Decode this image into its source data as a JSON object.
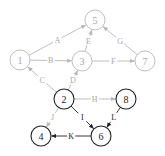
{
  "colors": {
    "light": "#b8b8b8",
    "light_text": "#a8a8a8",
    "dark": "#222222",
    "dark_text": "#222222",
    "background": "#ffffff"
  },
  "nodes": [
    {
      "id": "1",
      "label": "1",
      "x": 20,
      "y": 60,
      "r": 10,
      "style": "light"
    },
    {
      "id": "5",
      "label": "5",
      "x": 95,
      "y": 20,
      "r": 10,
      "style": "light"
    },
    {
      "id": "3",
      "label": "3",
      "x": 82,
      "y": 61,
      "r": 10,
      "style": "light"
    },
    {
      "id": "7",
      "label": "7",
      "x": 145,
      "y": 61,
      "r": 10,
      "style": "light"
    },
    {
      "id": "2",
      "label": "2",
      "x": 64,
      "y": 99,
      "r": 10,
      "style": "dark"
    },
    {
      "id": "8",
      "label": "8",
      "x": 126,
      "y": 99,
      "r": 10,
      "style": "dark"
    },
    {
      "id": "4",
      "label": "4",
      "x": 41,
      "y": 136,
      "r": 10,
      "style": "dark"
    },
    {
      "id": "6",
      "label": "6",
      "x": 101,
      "y": 136,
      "r": 10,
      "style": "dark"
    }
  ],
  "edges": [
    {
      "label": "A",
      "from": "1",
      "to": "5",
      "style": "light"
    },
    {
      "label": "B",
      "from": "1",
      "to": "3",
      "style": "light"
    },
    {
      "label": "C",
      "from": "2",
      "to": "1",
      "style": "light"
    },
    {
      "label": "D",
      "from": "2",
      "to": "3",
      "style": "light"
    },
    {
      "label": "E",
      "from": "3",
      "to": "5",
      "style": "light"
    },
    {
      "label": "F",
      "from": "3",
      "to": "7",
      "style": "light"
    },
    {
      "label": "G",
      "from": "7",
      "to": "5",
      "style": "light"
    },
    {
      "label": "H",
      "from": "2",
      "to": "8",
      "style": "light"
    },
    {
      "label": "I",
      "from": "2",
      "to": "6",
      "style": "dark"
    },
    {
      "label": "J",
      "from": "2",
      "to": "4",
      "style": "light"
    },
    {
      "label": "K",
      "from": "6",
      "to": "4",
      "style": "dark"
    },
    {
      "label": "L",
      "from": "8",
      "to": "6",
      "style": "dark"
    }
  ]
}
